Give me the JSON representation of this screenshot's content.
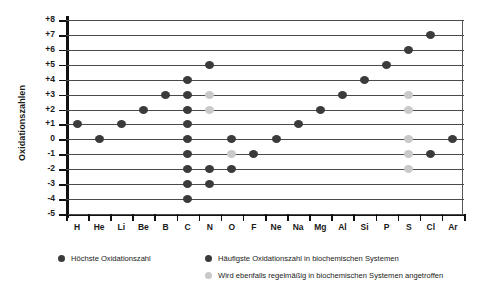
{
  "chart_data": {
    "type": "scatter",
    "title": "",
    "xlabel": "",
    "ylabel": "Oxidationszahlen",
    "ylim": [
      -5,
      8
    ],
    "yticks": [
      "+8",
      "+7",
      "+6",
      "+5",
      "+4",
      "+3",
      "+2",
      "+1",
      "0",
      "-1",
      "-2",
      "-3",
      "-4",
      "-5"
    ],
    "ytick_values": [
      8,
      7,
      6,
      5,
      4,
      3,
      2,
      1,
      0,
      -1,
      -2,
      -3,
      -4,
      -5
    ],
    "grid": true,
    "legend_position": "below",
    "categories": [
      "H",
      "He",
      "Li",
      "Be",
      "B",
      "C",
      "N",
      "O",
      "F",
      "Ne",
      "Na",
      "Mg",
      "Al",
      "Si",
      "P",
      "S",
      "Cl",
      "Ar"
    ],
    "series": [
      {
        "name": "Höchste Oxidationszahl",
        "key": "dark",
        "color": "#3b3b3b",
        "points": [
          {
            "x": "H",
            "y": 1
          },
          {
            "x": "He",
            "y": 0
          },
          {
            "x": "Li",
            "y": 1
          },
          {
            "x": "Be",
            "y": 2
          },
          {
            "x": "B",
            "y": 3
          },
          {
            "x": "C",
            "y": 4
          },
          {
            "x": "C",
            "y": 3
          },
          {
            "x": "C",
            "y": 2
          },
          {
            "x": "C",
            "y": 1
          },
          {
            "x": "C",
            "y": 0
          },
          {
            "x": "C",
            "y": -1
          },
          {
            "x": "C",
            "y": -2
          },
          {
            "x": "C",
            "y": -3
          },
          {
            "x": "C",
            "y": -4
          },
          {
            "x": "N",
            "y": 5
          },
          {
            "x": "N",
            "y": -2
          },
          {
            "x": "N",
            "y": -3
          },
          {
            "x": "O",
            "y": 0
          },
          {
            "x": "O",
            "y": -2
          },
          {
            "x": "F",
            "y": -1
          },
          {
            "x": "Ne",
            "y": 0
          },
          {
            "x": "Na",
            "y": 1
          },
          {
            "x": "Mg",
            "y": 2
          },
          {
            "x": "Al",
            "y": 3
          },
          {
            "x": "Si",
            "y": 4
          },
          {
            "x": "P",
            "y": 5
          },
          {
            "x": "S",
            "y": 6
          },
          {
            "x": "Cl",
            "y": 7
          },
          {
            "x": "Cl",
            "y": -1
          },
          {
            "x": "Ar",
            "y": 0
          }
        ]
      },
      {
        "name": "Wird ebenfalls regelmäßig in biochemischen Systemen angetroffen",
        "key": "light",
        "color": "#c9c9c9",
        "points": [
          {
            "x": "N",
            "y": 3
          },
          {
            "x": "N",
            "y": 2
          },
          {
            "x": "O",
            "y": -1
          },
          {
            "x": "S",
            "y": 3
          },
          {
            "x": "S",
            "y": 2
          },
          {
            "x": "S",
            "y": 0
          },
          {
            "x": "S",
            "y": -1
          },
          {
            "x": "S",
            "y": -2
          }
        ]
      }
    ]
  },
  "legend": {
    "items": [
      {
        "style": "dark",
        "label": "Höchste Oxidationszahl"
      },
      {
        "style": "dark",
        "label": "Häufigste Oxidationszahl in biochemischen Systemen"
      },
      {
        "style": "light",
        "label": "Wird ebenfalls regelmäßig in biochemischen Systemen angetroffen"
      }
    ]
  }
}
